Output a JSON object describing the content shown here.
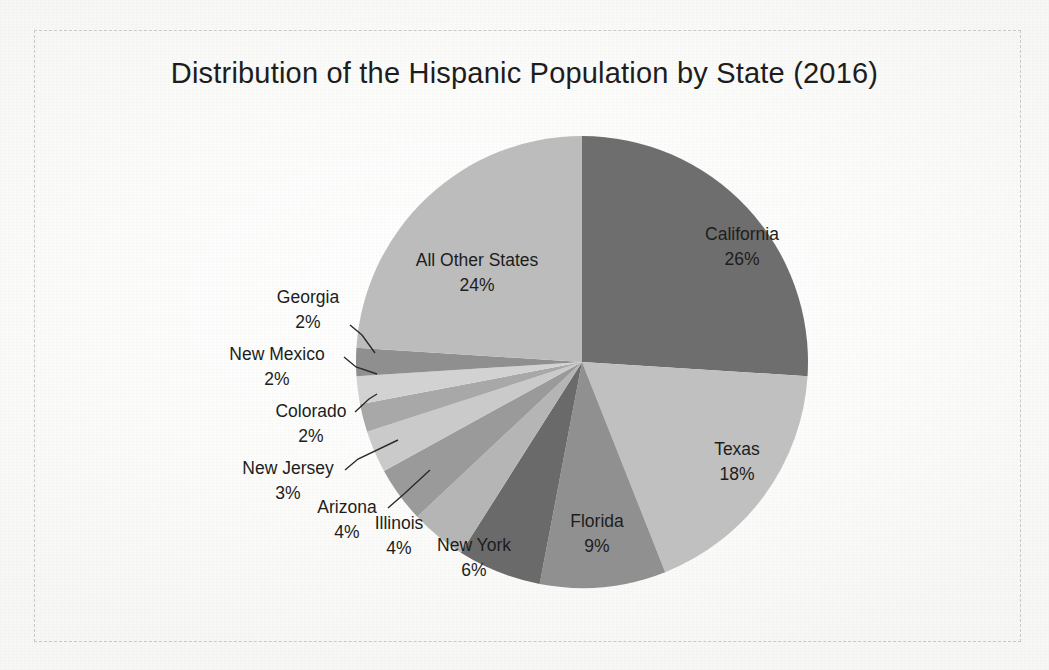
{
  "chart_data": {
    "type": "pie",
    "title": "Distribution of the Hispanic Population by State (2016)",
    "unit": "%",
    "categories": [
      "California",
      "Texas",
      "Florida",
      "New York",
      "Illinois",
      "Arizona",
      "New Jersey",
      "Colorado",
      "New Mexico",
      "Georgia",
      "All Other States"
    ],
    "values": [
      26,
      18,
      9,
      6,
      4,
      4,
      3,
      2,
      2,
      2,
      24
    ],
    "colors": [
      "#6e6e6e",
      "#c0c0c0",
      "#909090",
      "#6a6a6a",
      "#b5b5b5",
      "#9a9a9a",
      "#cacaca",
      "#a8a8a8",
      "#d2d2d2",
      "#8f8f8f",
      "#bcbcbc"
    ],
    "start_angle_deg": 0,
    "direction": "clockwise",
    "legend": "none",
    "grid": false,
    "labels": [
      {
        "name": "California",
        "value": "26%",
        "placement": "inside",
        "lx": 742,
        "ly": 240,
        "leader": null
      },
      {
        "name": "Texas",
        "value": "18%",
        "placement": "inside",
        "lx": 737,
        "ly": 455,
        "leader": null
      },
      {
        "name": "Florida",
        "value": "9%",
        "placement": "inside",
        "lx": 597,
        "ly": 527,
        "leader": null
      },
      {
        "name": "New York",
        "value": "6%",
        "placement": "outside",
        "lx": 474,
        "ly": 551,
        "anchor": "middle",
        "leader": null
      },
      {
        "name": "Illinois",
        "value": "4%",
        "placement": "outside",
        "lx": 399,
        "ly": 529,
        "anchor": "middle",
        "leader": null
      },
      {
        "name": "Arizona",
        "value": "4%",
        "placement": "outside",
        "lx": 347,
        "ly": 513,
        "anchor": "middle",
        "leader": [
          [
            388,
            508
          ],
          [
            404,
            494
          ],
          [
            430,
            470
          ]
        ]
      },
      {
        "name": "New Jersey",
        "value": "3%",
        "placement": "outside",
        "lx": 288,
        "ly": 474,
        "anchor": "middle",
        "leader": [
          [
            345,
            470
          ],
          [
            358,
            459
          ],
          [
            398,
            440
          ]
        ]
      },
      {
        "name": "Colorado",
        "value": "2%",
        "placement": "outside",
        "lx": 311,
        "ly": 417,
        "anchor": "middle",
        "leader": [
          [
            355,
            412
          ],
          [
            369,
            399
          ],
          [
            377,
            394
          ]
        ]
      },
      {
        "name": "New Mexico",
        "value": "2%",
        "placement": "outside",
        "lx": 277,
        "ly": 360,
        "anchor": "middle",
        "leader": [
          [
            344,
            357
          ],
          [
            356,
            367
          ],
          [
            377,
            374
          ]
        ]
      },
      {
        "name": "Georgia",
        "value": "2%",
        "placement": "outside",
        "lx": 308,
        "ly": 303,
        "anchor": "middle",
        "leader": [
          [
            350,
            325
          ],
          [
            362,
            335
          ],
          [
            375,
            353
          ]
        ]
      },
      {
        "name": "All Other States",
        "value": "24%",
        "placement": "inside",
        "lx": 477,
        "ly": 266,
        "leader": null
      }
    ],
    "geometry": {
      "cx": 582,
      "cy": 362,
      "r": 226
    }
  },
  "page": {
    "background_color": "#fdfdfd",
    "frame_style": "dashed",
    "frame_color": "#c9c9c9"
  }
}
